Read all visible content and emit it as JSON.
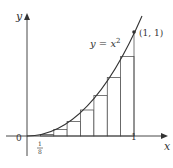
{
  "figure": {
    "curve_label": "y = x²",
    "curve_label_base": "y = x",
    "curve_label_exp": "2",
    "point_label": "(1, 1)",
    "axis_x_label": "x",
    "axis_y_label": "y",
    "origin_label": "0",
    "tick_one_label": "1",
    "tick_eighth_num": "1",
    "tick_eighth_den": "8",
    "function": "x^2",
    "interval": [
      0,
      1
    ],
    "subintervals": 8,
    "rectangle_rule": "left endpoints",
    "rectangle_heights": [
      0,
      0.015625,
      0.0625,
      0.140625,
      0.25,
      0.390625,
      0.5625,
      0.765625
    ],
    "colors": {
      "stroke": "#333333",
      "rect_fill": "#ffffff",
      "background": "#ffffff"
    }
  }
}
